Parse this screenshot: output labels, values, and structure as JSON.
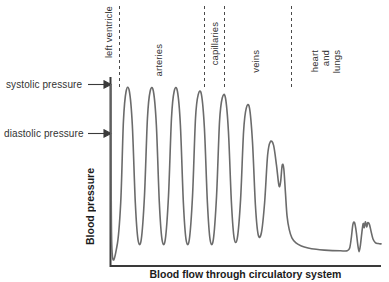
{
  "chart_data": {
    "type": "line",
    "title": "",
    "ylabel": "Blood pressure",
    "xlabel": "Blood flow through circulatory system",
    "xlim": [
      0,
      100
    ],
    "ylim": [
      0,
      100
    ],
    "grid": false,
    "legend": null,
    "series": [
      {
        "name": "blood pressure waveform",
        "description": "Pulsatile arterial pressure oscillating between systolic and diastolic, damping through arterioles, dropping sharply across capillaries, low and flat in veins, then small pulses through heart and lungs.",
        "points": [
          [
            0.0,
            100.0
          ],
          [
            0.3,
            4.0
          ],
          [
            2.2,
            4.0
          ],
          [
            3.6,
            30.0
          ],
          [
            4.6,
            78.0
          ],
          [
            5.6,
            96.0
          ],
          [
            6.8,
            96.0
          ],
          [
            7.9,
            76.0
          ],
          [
            9.0,
            30.0
          ],
          [
            10.0,
            8.0
          ],
          [
            11.2,
            8.0
          ],
          [
            12.4,
            34.0
          ],
          [
            13.5,
            80.0
          ],
          [
            14.5,
            96.0
          ],
          [
            15.7,
            96.0
          ],
          [
            16.8,
            76.0
          ],
          [
            17.9,
            30.0
          ],
          [
            18.9,
            8.0
          ],
          [
            20.1,
            8.0
          ],
          [
            21.3,
            34.0
          ],
          [
            22.4,
            80.0
          ],
          [
            23.4,
            96.0
          ],
          [
            24.6,
            96.0
          ],
          [
            25.7,
            76.0
          ],
          [
            26.8,
            30.0
          ],
          [
            27.8,
            8.0
          ],
          [
            29.0,
            8.0
          ],
          [
            30.2,
            34.0
          ],
          [
            31.3,
            80.0
          ],
          [
            32.3,
            94.0
          ],
          [
            33.5,
            94.0
          ],
          [
            34.6,
            74.0
          ],
          [
            35.7,
            30.0
          ],
          [
            36.7,
            8.0
          ],
          [
            37.9,
            8.0
          ],
          [
            39.1,
            34.0
          ],
          [
            40.2,
            78.0
          ],
          [
            41.2,
            92.0
          ],
          [
            42.4,
            92.0
          ],
          [
            43.5,
            72.0
          ],
          [
            44.6,
            30.0
          ],
          [
            45.6,
            9.0
          ],
          [
            46.8,
            9.0
          ],
          [
            48.0,
            32.0
          ],
          [
            49.1,
            72.0
          ],
          [
            50.1,
            86.0
          ],
          [
            51.3,
            86.0
          ],
          [
            52.4,
            66.0
          ],
          [
            53.5,
            28.0
          ],
          [
            54.5,
            11.0
          ],
          [
            55.7,
            12.0
          ],
          [
            56.9,
            30.0
          ],
          [
            58.0,
            58.0
          ],
          [
            59.0,
            66.0
          ],
          [
            60.2,
            64.0
          ],
          [
            61.3,
            52.0
          ],
          [
            62.2,
            40.0
          ],
          [
            62.8,
            42.0
          ],
          [
            63.4,
            52.0
          ],
          [
            64.0,
            50.0
          ],
          [
            64.6,
            36.0
          ],
          [
            65.2,
            22.0
          ],
          [
            66.0,
            14.0
          ],
          [
            67.0,
            9.0
          ],
          [
            68.5,
            6.0
          ],
          [
            70.5,
            4.2
          ],
          [
            73.0,
            3.0
          ],
          [
            76.0,
            2.2
          ],
          [
            79.0,
            1.7
          ],
          [
            82.0,
            1.4
          ],
          [
            85.0,
            1.3
          ],
          [
            87.5,
            1.3
          ],
          [
            88.4,
            3.0
          ],
          [
            89.0,
            9.0
          ],
          [
            89.6,
            17.0
          ],
          [
            90.2,
            18.0
          ],
          [
            90.8,
            13.0
          ],
          [
            91.4,
            5.0
          ],
          [
            91.9,
            0.8
          ],
          [
            92.4,
            5.0
          ],
          [
            92.9,
            12.0
          ],
          [
            93.4,
            17.5
          ],
          [
            93.8,
            15.0
          ],
          [
            94.2,
            18.5
          ],
          [
            94.7,
            15.5
          ],
          [
            95.1,
            18.0
          ],
          [
            95.7,
            17.0
          ],
          [
            96.3,
            13.0
          ],
          [
            97.0,
            8.5
          ],
          [
            97.9,
            6.2
          ],
          [
            99.0,
            5.6
          ],
          [
            100.0,
            5.4
          ]
        ]
      }
    ],
    "annotations": [
      {
        "id": "systolic",
        "label": "systolic pressure",
        "type": "arrow-label",
        "y": 100.0
      },
      {
        "id": "diastolic",
        "label": "diastolic pressure",
        "type": "arrow-label",
        "y": 74.0
      }
    ],
    "regions": [
      {
        "id": "left-ventricle",
        "label": "left ventricle",
        "x_start": 0.0,
        "x_end": 3.5
      },
      {
        "id": "arteries",
        "label": "arteries",
        "x_start": 3.5,
        "x_end": 33.5
      },
      {
        "id": "capillaries",
        "label": "capillaries",
        "x_start": 33.5,
        "x_end": 41.0
      },
      {
        "id": "veins",
        "label": "veins",
        "x_start": 41.0,
        "x_end": 65.0
      },
      {
        "id": "heart-and-lungs",
        "label": "heart and lungs",
        "x_start": 65.0,
        "x_end": 100.0
      }
    ],
    "divider_labels": {
      "left_ventricle": "left ventricle",
      "arteries": "arteries",
      "capillaries": "capillaries",
      "veins": "veins",
      "heart": "heart",
      "and": "and",
      "lungs": "lungs"
    },
    "colors": {
      "curve": "#6b6b6b",
      "axis": "#3a3a3a",
      "divider": "#4a4a4a",
      "label": "#333333",
      "background": "#ffffff"
    }
  }
}
